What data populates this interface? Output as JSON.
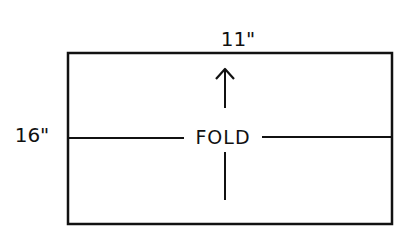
{
  "diagram": {
    "width_label": "11\"",
    "height_label": "16\"",
    "fold_label": "FOLD",
    "arrow_direction": "up",
    "stroke_color": "#111111",
    "background_color": "#ffffff"
  }
}
